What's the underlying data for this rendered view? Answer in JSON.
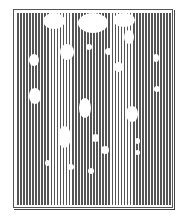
{
  "figure": {
    "stripe_color": "#555555",
    "background_color": "#ffffff",
    "frame_color": "#555555",
    "stripe_pitch_px": 3.05,
    "blobs": [
      {
        "x": 43,
        "y": 13,
        "w": 22,
        "h": 16
      },
      {
        "x": 78,
        "y": 13,
        "w": 30,
        "h": 20
      },
      {
        "x": 113,
        "y": 13,
        "w": 22,
        "h": 14
      },
      {
        "x": 124,
        "y": 30,
        "w": 10,
        "h": 14
      },
      {
        "x": 60,
        "y": 44,
        "w": 14,
        "h": 16
      },
      {
        "x": 86,
        "y": 44,
        "w": 6,
        "h": 6
      },
      {
        "x": 105,
        "y": 48,
        "w": 7,
        "h": 7
      },
      {
        "x": 29,
        "y": 54,
        "w": 10,
        "h": 12
      },
      {
        "x": 153,
        "y": 54,
        "w": 6,
        "h": 8
      },
      {
        "x": 114,
        "y": 62,
        "w": 9,
        "h": 10
      },
      {
        "x": 154,
        "y": 86,
        "w": 6,
        "h": 6
      },
      {
        "x": 29,
        "y": 88,
        "w": 12,
        "h": 16
      },
      {
        "x": 79,
        "y": 98,
        "w": 12,
        "h": 20
      },
      {
        "x": 126,
        "y": 106,
        "w": 12,
        "h": 16
      },
      {
        "x": 58,
        "y": 126,
        "w": 13,
        "h": 22
      },
      {
        "x": 92,
        "y": 134,
        "w": 7,
        "h": 8
      },
      {
        "x": 135,
        "y": 138,
        "w": 5,
        "h": 6
      },
      {
        "x": 101,
        "y": 146,
        "w": 8,
        "h": 8
      },
      {
        "x": 135,
        "y": 150,
        "w": 5,
        "h": 5
      },
      {
        "x": 45,
        "y": 160,
        "w": 5,
        "h": 6
      },
      {
        "x": 67,
        "y": 164,
        "w": 7,
        "h": 6
      },
      {
        "x": 88,
        "y": 168,
        "w": 6,
        "h": 6
      }
    ]
  }
}
